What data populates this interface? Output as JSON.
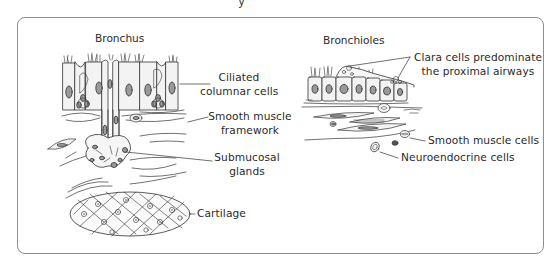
{
  "header": {
    "fragment": "y"
  },
  "panels": {
    "bronchus": {
      "title": "Bronchus",
      "labels": {
        "ciliated": [
          "Ciliated",
          "columnar cells"
        ],
        "smooth_muscle": [
          "Smooth muscle",
          "framework"
        ],
        "glands": [
          "Submucosal",
          "glands"
        ],
        "cartilage": "Cartilage"
      }
    },
    "bronchioles": {
      "title": "Bronchioles",
      "labels": {
        "clara": [
          "Clara cells predominate",
          "the proximal airways"
        ],
        "smooth_muscle_cells": "Smooth muscle cells",
        "neuroendocrine": "Neuroendocrine cells"
      }
    }
  },
  "colors": {
    "frame": "#8f8f8f",
    "line": "#333333",
    "cell_fill": "#f2f2f2",
    "nucleus": "#9a9a9a"
  }
}
